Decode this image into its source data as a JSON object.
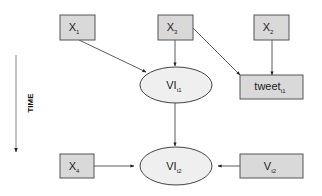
{
  "diagram": {
    "type": "causal-path-diagram",
    "colors": {
      "box_fill": "#d9d9d9",
      "ellipse_fill": "#efefef",
      "stroke": "#444444"
    },
    "time_axis": {
      "label": "TIME",
      "direction": "down"
    },
    "nodes": [
      {
        "id": "x1",
        "shape": "rect",
        "base": "X",
        "sub": "1"
      },
      {
        "id": "x3",
        "shape": "rect",
        "base": "X",
        "sub": "3"
      },
      {
        "id": "x2",
        "shape": "rect",
        "base": "X",
        "sub": "2"
      },
      {
        "id": "vi_t1",
        "shape": "ellipse",
        "base": "VI",
        "sub": "t1"
      },
      {
        "id": "tweet_t1",
        "shape": "rect",
        "base": "tweet",
        "sub": "t1"
      },
      {
        "id": "x4",
        "shape": "rect",
        "base": "X",
        "sub": "4"
      },
      {
        "id": "vi_t2",
        "shape": "ellipse",
        "base": "VI",
        "sub": "t2"
      },
      {
        "id": "v_t2",
        "shape": "rect",
        "base": "V",
        "sub": "t2"
      }
    ],
    "edges": [
      {
        "from": "x1",
        "to": "vi_t1"
      },
      {
        "from": "x3",
        "to": "vi_t1"
      },
      {
        "from": "x3",
        "to": "tweet_t1"
      },
      {
        "from": "x2",
        "to": "tweet_t1"
      },
      {
        "from": "vi_t1",
        "to": "vi_t2"
      },
      {
        "from": "x4",
        "to": "vi_t2"
      },
      {
        "from": "v_t2",
        "to": "vi_t2"
      }
    ]
  }
}
